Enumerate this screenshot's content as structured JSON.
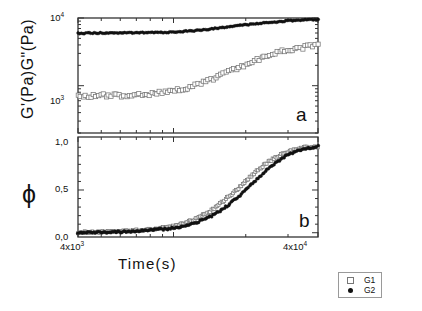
{
  "figure": {
    "panels": [
      {
        "id": "a",
        "letter": "a"
      },
      {
        "id": "b",
        "letter": "b"
      }
    ]
  },
  "axes": {
    "y_a": {
      "label": "G'(Pa)G\"(Pa)",
      "scale": "log",
      "ticks": [
        "10³",
        "10⁴"
      ],
      "tick_values": [
        1000,
        10000
      ],
      "lim": [
        200,
        10000
      ]
    },
    "y_b": {
      "label": "ϕ",
      "scale": "linear",
      "ticks": [
        "0,0",
        "0,5",
        "1,0"
      ],
      "tick_values": [
        0.0,
        0.5,
        1.0
      ],
      "lim": [
        -0.05,
        1.12
      ]
    },
    "x": {
      "label": "Time(s)",
      "scale": "log",
      "ticks": [
        "4x10³",
        "4x10⁴"
      ],
      "tick_values": [
        4000,
        40000
      ],
      "lim": [
        4000,
        40000
      ]
    }
  },
  "legend": {
    "position": "bottom-right-outside",
    "entries": [
      {
        "label": "G1",
        "marker": "open-square",
        "color": "#777777"
      },
      {
        "label": "G2",
        "marker": "filled-circle",
        "color": "#111111"
      }
    ]
  },
  "colors": {
    "axis": "#333333",
    "g1": "#777777",
    "g2": "#111111",
    "fit_line": "#000000"
  },
  "chart_data": {
    "type": "scatter",
    "title": "",
    "xlabel": "Time(s)",
    "xscale": "log",
    "xlim": [
      4000,
      40000
    ],
    "xticks": [
      4000,
      40000
    ],
    "xticklabels": [
      "4x10³",
      "4x10⁴"
    ],
    "grid": false,
    "legend_position": "bottom-right-outside",
    "panels": [
      {
        "panel": "a",
        "ylabel": "G'(Pa)G\"(Pa)",
        "yscale": "log",
        "ylim": [
          200,
          10000
        ],
        "yticks": [
          1000,
          10000
        ],
        "yticklabels": [
          "10³",
          "10⁴"
        ],
        "annotation": "a",
        "series": [
          {
            "name": "G2",
            "marker": "filled-circle",
            "x": [
              4000,
              4600,
              5300,
              6100,
              7000,
              8100,
              9300,
              10700,
              12300,
              14200,
              16300,
              18800,
              21600,
              24800,
              28600,
              32900,
              36000,
              40000
            ],
            "y": [
              5950,
              5980,
              6000,
              6020,
              6050,
              6080,
              6150,
              6280,
              6500,
              6850,
              7250,
              7700,
              8150,
              8550,
              8950,
              9250,
              9400,
              9550
            ]
          },
          {
            "name": "G1",
            "marker": "open-square",
            "x": [
              4000,
              4600,
              5300,
              6100,
              7000,
              8100,
              9300,
              10700,
              12300,
              14200,
              16300,
              18800,
              21600,
              24800,
              28600,
              32900,
              36000,
              40000
            ],
            "y": [
              690,
              700,
              720,
              720,
              740,
              760,
              800,
              880,
              1000,
              1200,
              1480,
              1850,
              2300,
              2800,
              3250,
              3550,
              3750,
              3950
            ]
          }
        ]
      },
      {
        "panel": "b",
        "ylabel": "ϕ",
        "yscale": "linear",
        "ylim": [
          -0.05,
          1.12
        ],
        "yticks": [
          0.0,
          0.5,
          1.0
        ],
        "yticklabels": [
          "0,0",
          "0,5",
          "1,0"
        ],
        "annotation": "b",
        "series": [
          {
            "name": "G1",
            "marker": "open-square",
            "x": [
              4000,
              4600,
              5300,
              6100,
              7000,
              8100,
              9300,
              10700,
              12300,
              14200,
              16300,
              18800,
              21600,
              24800,
              28600,
              32900,
              36000,
              40000
            ],
            "y": [
              0.005,
              0.008,
              0.012,
              0.018,
              0.027,
              0.04,
              0.06,
              0.095,
              0.155,
              0.25,
              0.38,
              0.53,
              0.69,
              0.83,
              0.93,
              0.98,
              1.0,
              1.01
            ]
          },
          {
            "name": "G2",
            "marker": "filled-circle",
            "x": [
              4000,
              4600,
              5300,
              6100,
              7000,
              8100,
              9300,
              10700,
              12300,
              14200,
              16300,
              18800,
              21600,
              24800,
              28600,
              32900,
              36000,
              40000
            ],
            "y": [
              0.004,
              0.006,
              0.009,
              0.013,
              0.02,
              0.03,
              0.045,
              0.07,
              0.115,
              0.185,
              0.29,
              0.43,
              0.59,
              0.75,
              0.88,
              0.96,
              0.99,
              1.01
            ]
          }
        ]
      }
    ]
  }
}
